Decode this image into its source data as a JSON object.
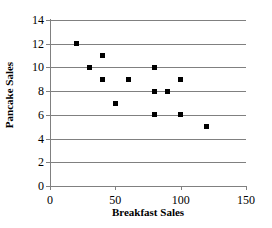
{
  "chart_data": {
    "type": "scatter",
    "title": "",
    "xlabel": "Breakfast Sales",
    "ylabel": "Pancake Sales",
    "xlim": [
      0,
      150
    ],
    "ylim": [
      0,
      14
    ],
    "xticks": [
      0,
      50,
      100,
      150
    ],
    "yticks": [
      0,
      2,
      4,
      6,
      8,
      10,
      12,
      14
    ],
    "grid": "horizontal",
    "legend": "none",
    "marker": "square",
    "marker_color": "#000000",
    "gridline_color": "#808080",
    "axis_color": "#808080",
    "background_color": "#ffffff",
    "points": [
      {
        "x": 20,
        "y": 12
      },
      {
        "x": 30,
        "y": 10
      },
      {
        "x": 40,
        "y": 11
      },
      {
        "x": 40,
        "y": 9
      },
      {
        "x": 50,
        "y": 7
      },
      {
        "x": 60,
        "y": 9
      },
      {
        "x": 80,
        "y": 10
      },
      {
        "x": 80,
        "y": 8
      },
      {
        "x": 80,
        "y": 6
      },
      {
        "x": 90,
        "y": 8
      },
      {
        "x": 100,
        "y": 9
      },
      {
        "x": 100,
        "y": 6
      },
      {
        "x": 120,
        "y": 5
      }
    ],
    "x": [
      20,
      30,
      40,
      40,
      50,
      60,
      80,
      80,
      80,
      90,
      100,
      100,
      120
    ],
    "y": [
      12,
      10,
      11,
      9,
      7,
      9,
      10,
      8,
      6,
      8,
      9,
      6,
      5
    ]
  }
}
